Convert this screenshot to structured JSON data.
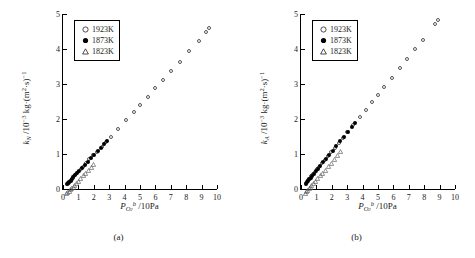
{
  "figure": {
    "panels": [
      {
        "caption": "(a)",
        "legend": [
          {
            "symbol": "open-circle",
            "label": "1923K"
          },
          {
            "symbol": "filled-circle",
            "label": "1873K"
          },
          {
            "symbol": "open-triangle",
            "label": "1823K"
          }
        ],
        "ylabel_parts": {
          "sym": "k",
          "sub": "N",
          "unit": "/10",
          "exp": "-3",
          "unit2": " kg·(m",
          "exp2": "2",
          "unit3": "·s)",
          "exp3": "-1"
        },
        "xlabel_parts": {
          "sym": "P",
          "sub": "O",
          "sub2": "2",
          "sup": "b",
          "unit": " /10Pa"
        }
      },
      {
        "caption": "(b)",
        "legend": [
          {
            "symbol": "open-circle",
            "label": "1923K"
          },
          {
            "symbol": "filled-circle",
            "label": "1873K"
          },
          {
            "symbol": "open-triangle",
            "label": "1823K"
          }
        ],
        "ylabel_parts": {
          "sym": "k",
          "sub": "A",
          "unit": "/10",
          "exp": "-3",
          "unit2": " kg·(m",
          "exp2": "2",
          "unit3": "·s)",
          "exp3": "-1"
        },
        "xlabel_parts": {
          "sym": "P",
          "sub": "O",
          "sub2": "2",
          "sup": "b",
          "unit": " /10Pa"
        }
      }
    ]
  },
  "chart_data": [
    {
      "type": "scatter",
      "title": "",
      "panel": "(a)",
      "xlabel": "P_O2^b /10Pa",
      "ylabel": "k_N /10^-3 kg·(m^2·s)^-1",
      "xlim": [
        0,
        10
      ],
      "ylim": [
        0,
        5
      ],
      "xticks": [
        0,
        1,
        2,
        3,
        4,
        5,
        6,
        7,
        8,
        9,
        10
      ],
      "yticks": [
        0,
        1,
        2,
        3,
        4,
        5
      ],
      "grid": false,
      "legend_position": "top-left",
      "series": [
        {
          "name": "1923K",
          "marker": "open-circle",
          "points": [
            [
              0.3,
              0.14
            ],
            [
              0.38,
              0.18
            ],
            [
              0.45,
              0.22
            ],
            [
              0.52,
              0.26
            ],
            [
              0.62,
              0.31
            ],
            [
              0.72,
              0.36
            ],
            [
              0.85,
              0.42
            ],
            [
              0.98,
              0.49
            ],
            [
              1.15,
              0.57
            ],
            [
              1.3,
              0.64
            ],
            [
              1.5,
              0.74
            ],
            [
              1.72,
              0.85
            ],
            [
              1.95,
              0.96
            ],
            [
              2.2,
              1.06
            ],
            [
              2.5,
              1.2
            ],
            [
              2.8,
              1.34
            ],
            [
              3.1,
              1.49
            ],
            [
              3.6,
              1.72
            ],
            [
              4.1,
              1.97
            ],
            [
              4.6,
              2.21
            ],
            [
              5.0,
              2.4
            ],
            [
              5.5,
              2.64
            ],
            [
              6.0,
              2.88
            ],
            [
              6.5,
              3.12
            ],
            [
              7.0,
              3.36
            ],
            [
              7.6,
              3.64
            ],
            [
              8.2,
              3.93
            ],
            [
              8.8,
              4.22
            ],
            [
              9.3,
              4.5
            ],
            [
              9.5,
              4.6
            ]
          ]
        },
        {
          "name": "1873K",
          "marker": "filled-circle",
          "points": [
            [
              0.28,
              0.13
            ],
            [
              0.35,
              0.17
            ],
            [
              0.42,
              0.2
            ],
            [
              0.5,
              0.24
            ],
            [
              0.58,
              0.28
            ],
            [
              0.68,
              0.33
            ],
            [
              0.8,
              0.39
            ],
            [
              0.92,
              0.45
            ],
            [
              1.05,
              0.51
            ],
            [
              1.22,
              0.59
            ],
            [
              1.4,
              0.68
            ],
            [
              1.6,
              0.78
            ],
            [
              1.8,
              0.88
            ],
            [
              2.0,
              0.97
            ],
            [
              2.25,
              1.09
            ],
            [
              2.45,
              1.18
            ],
            [
              2.65,
              1.28
            ],
            [
              2.85,
              1.38
            ]
          ]
        },
        {
          "name": "1823K",
          "marker": "open-triangle",
          "points": [
            [
              0.25,
              0.12
            ],
            [
              0.32,
              0.15
            ],
            [
              0.4,
              0.19
            ],
            [
              0.48,
              0.23
            ],
            [
              0.56,
              0.27
            ],
            [
              0.65,
              0.31
            ],
            [
              0.75,
              0.36
            ],
            [
              0.88,
              0.42
            ],
            [
              1.0,
              0.48
            ],
            [
              1.15,
              0.55
            ],
            [
              1.32,
              0.63
            ],
            [
              1.48,
              0.71
            ],
            [
              1.65,
              0.79
            ],
            [
              1.82,
              0.87
            ],
            [
              2.0,
              0.96
            ]
          ]
        }
      ]
    },
    {
      "type": "scatter",
      "title": "",
      "panel": "(b)",
      "xlabel": "P_O2^b /10Pa",
      "ylabel": "k_A /10^-3 kg·(m^2·s)^-1",
      "xlim": [
        0,
        10
      ],
      "ylim": [
        0,
        5
      ],
      "xticks": [
        0,
        1,
        2,
        3,
        4,
        5,
        6,
        7,
        8,
        9,
        10
      ],
      "yticks": [
        0,
        1,
        2,
        3,
        4,
        5
      ],
      "grid": false,
      "legend_position": "top-left",
      "series": [
        {
          "name": "1923K",
          "marker": "open-circle",
          "points": [
            [
              0.32,
              0.16
            ],
            [
              0.4,
              0.21
            ],
            [
              0.48,
              0.26
            ],
            [
              0.56,
              0.3
            ],
            [
              0.66,
              0.36
            ],
            [
              0.78,
              0.42
            ],
            [
              0.9,
              0.49
            ],
            [
              1.02,
              0.56
            ],
            [
              1.18,
              0.64
            ],
            [
              1.35,
              0.73
            ],
            [
              1.55,
              0.84
            ],
            [
              1.75,
              0.95
            ],
            [
              1.95,
              1.06
            ],
            [
              2.2,
              1.18
            ],
            [
              2.45,
              1.32
            ],
            [
              2.7,
              1.45
            ],
            [
              3.0,
              1.62
            ],
            [
              3.4,
              1.83
            ],
            [
              3.8,
              2.05
            ],
            [
              4.2,
              2.27
            ],
            [
              4.6,
              2.48
            ],
            [
              5.0,
              2.7
            ],
            [
              5.4,
              2.92
            ],
            [
              5.9,
              3.18
            ],
            [
              6.4,
              3.45
            ],
            [
              6.9,
              3.72
            ],
            [
              7.4,
              4.0
            ],
            [
              7.9,
              4.25
            ],
            [
              8.7,
              4.72
            ],
            [
              8.9,
              4.82
            ]
          ]
        },
        {
          "name": "1873K",
          "marker": "filled-circle",
          "points": [
            [
              0.3,
              0.15
            ],
            [
              0.38,
              0.19
            ],
            [
              0.46,
              0.24
            ],
            [
              0.54,
              0.28
            ],
            [
              0.62,
              0.32
            ],
            [
              0.72,
              0.38
            ],
            [
              0.84,
              0.44
            ],
            [
              0.96,
              0.51
            ],
            [
              1.1,
              0.58
            ],
            [
              1.26,
              0.67
            ],
            [
              1.44,
              0.76
            ],
            [
              1.62,
              0.86
            ],
            [
              1.82,
              0.96
            ],
            [
              2.05,
              1.09
            ],
            [
              2.3,
              1.22
            ],
            [
              2.55,
              1.36
            ],
            [
              2.8,
              1.5
            ],
            [
              3.05,
              1.64
            ],
            [
              3.3,
              1.78
            ],
            [
              3.5,
              1.9
            ]
          ]
        },
        {
          "name": "1823K",
          "marker": "open-triangle",
          "points": [
            [
              0.28,
              0.14
            ],
            [
              0.36,
              0.18
            ],
            [
              0.44,
              0.22
            ],
            [
              0.52,
              0.26
            ],
            [
              0.6,
              0.3
            ],
            [
              0.7,
              0.35
            ],
            [
              0.82,
              0.41
            ],
            [
              0.95,
              0.48
            ],
            [
              1.08,
              0.55
            ],
            [
              1.24,
              0.63
            ],
            [
              1.4,
              0.71
            ],
            [
              1.58,
              0.8
            ],
            [
              1.76,
              0.89
            ],
            [
              1.95,
              0.99
            ],
            [
              2.15,
              1.1
            ],
            [
              2.35,
              1.21
            ],
            [
              2.55,
              1.32
            ]
          ]
        }
      ]
    }
  ]
}
